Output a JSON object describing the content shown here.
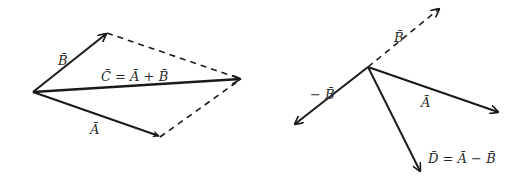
{
  "diagram": {
    "addition": {
      "title": "Vector addition (parallelogram)",
      "labels": {
        "B": "B̄",
        "A": "Ā",
        "C_eq": "C̄ = Ā + B̄"
      },
      "points": {
        "origin": [
          33,
          92
        ],
        "B_tip": [
          107,
          33
        ],
        "A_tip": [
          160,
          137
        ],
        "C_tip": [
          241,
          79
        ]
      }
    },
    "subtraction": {
      "title": "Vector subtraction",
      "labels": {
        "B": "B̄",
        "negB": "− B̄",
        "A": "Ā",
        "D_eq": "D̄ = Ā − B̄"
      },
      "points": {
        "origin": [
          368,
          67
        ],
        "B_tip": [
          440,
          8
        ],
        "negB_tip": [
          294,
          125
        ],
        "A_tip": [
          499,
          112
        ],
        "D_tip": [
          421,
          172
        ]
      }
    },
    "colors": {
      "stroke": "#1a1a1a",
      "text": "#2a2a2a",
      "background": "#ffffff"
    }
  }
}
